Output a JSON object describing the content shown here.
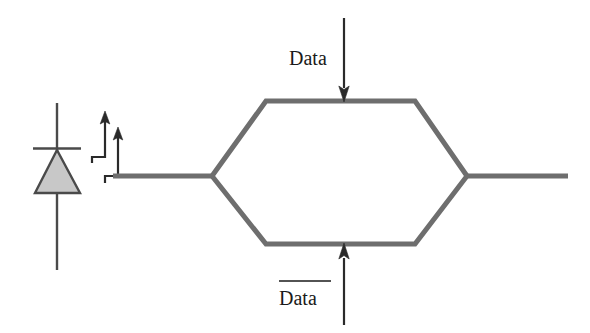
{
  "figure": {
    "kind": "timing-signal-diagram",
    "background_color": "#ffffff"
  },
  "colors": {
    "shape_stroke": "#6e6e6e",
    "wire_stroke": "#6e6e6e",
    "arrow_stroke": "#2a2a2a",
    "diode_stroke": "#4a4a4a",
    "diode_fill": "#c8c8c8",
    "text": "#1a1a1a"
  },
  "labels": {
    "top_input": "Data",
    "bottom_input": "Data",
    "bottom_input_overline": true
  },
  "elements": {
    "diode": {
      "name": "diode-symbol",
      "triangle_apex": [
        57,
        150
      ],
      "triangle_base_left": [
        35,
        193
      ],
      "triangle_base_right": [
        80,
        193
      ],
      "cathode_bar_y": 148,
      "cathode_bar_x1": 33,
      "cathode_bar_x2": 81,
      "lead_top_y": 103,
      "lead_bottom_y": 270
    },
    "clock_arrows": [
      {
        "name": "clock-step-arrow-1",
        "corner_x": 92,
        "corner_y": 157,
        "stem_x": 105,
        "tip_y": 112
      },
      {
        "name": "clock-step-arrow-2",
        "corner_x": 105,
        "corner_y": 176,
        "stem_x": 118,
        "tip_y": 128
      }
    ],
    "hexagon": {
      "name": "data-bus-hexagon",
      "left_vertex": [
        212,
        176
      ],
      "top_left": [
        266,
        101
      ],
      "top_right": [
        415,
        101
      ],
      "right_vertex": [
        467,
        176
      ],
      "bottom_right": [
        415,
        244
      ],
      "bottom_left": [
        266,
        244
      ],
      "stroke_width": 5
    },
    "wires": {
      "input_line": {
        "name": "input-wire",
        "x1": 113,
        "y1": 176,
        "x2": 212,
        "y2": 176
      },
      "output_line": {
        "name": "output-wire",
        "x1": 467,
        "y1": 176,
        "x2": 568,
        "y2": 176
      }
    },
    "data_arrows": {
      "top": {
        "name": "data-in-arrow-top",
        "x": 344,
        "y_start": 18,
        "y_end": 100,
        "direction": "down"
      },
      "bottom": {
        "name": "data-in-arrow-bottom",
        "x": 344,
        "y_start": 325,
        "y_end": 246,
        "direction": "up"
      }
    },
    "label_positions": {
      "top_label": [
        289,
        58
      ],
      "bottom_label": [
        285,
        300
      ],
      "bottom_overline": {
        "x1": 277,
        "x2": 330,
        "y": 280
      }
    }
  }
}
